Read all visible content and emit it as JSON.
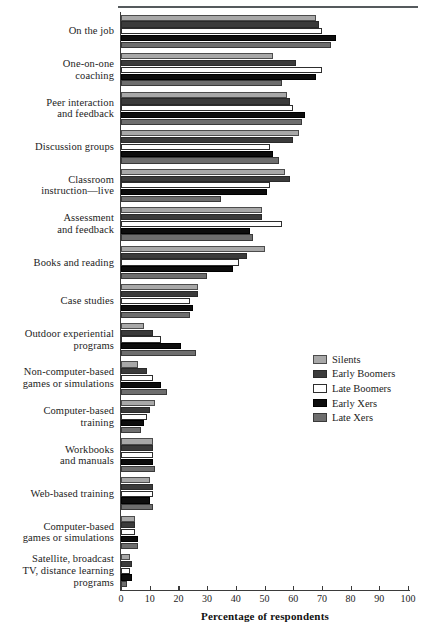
{
  "chart_data": {
    "type": "bar",
    "orientation": "horizontal",
    "title": "",
    "xlabel": "Percentage of respondents",
    "ylabel": "",
    "xlim": [
      0,
      100
    ],
    "xticks": [
      0,
      10,
      20,
      30,
      40,
      50,
      60,
      70,
      80,
      90,
      100
    ],
    "grid": false,
    "legend_position": "middle-right",
    "categories": [
      "On the job",
      "One-on-one\ncoaching",
      "Peer interaction\nand feedback",
      "Discussion groups",
      "Classroom\ninstruction—live",
      "Assessment\nand feedback",
      "Books and reading",
      "Case studies",
      "Outdoor experiential\nprograms",
      "Non-computer-based\ngames or simulations",
      "Computer-based\ntraining",
      "Workbooks\nand manuals",
      "Web-based training",
      "Computer-based\ngames or simulations",
      "Satellite, broadcast\nTV, distance learning\nprograms"
    ],
    "series": [
      {
        "name": "Silents",
        "color": "#a8a8a8",
        "values": [
          68,
          53,
          58,
          62,
          57,
          49,
          50,
          27,
          8,
          6,
          12,
          11,
          10,
          5,
          3
        ]
      },
      {
        "name": "Early Boomers",
        "color": "#3b3b3b",
        "values": [
          69,
          61,
          59,
          60,
          59,
          49,
          44,
          27,
          11,
          9,
          10,
          11,
          11,
          5,
          4
        ]
      },
      {
        "name": "Late Boomers",
        "color": "#ffffff",
        "values": [
          70,
          70,
          60,
          52,
          52,
          56,
          41,
          24,
          14,
          11,
          9,
          11,
          11,
          5,
          3
        ]
      },
      {
        "name": "Early Xers",
        "color": "#0d0d0d",
        "values": [
          75,
          68,
          64,
          53,
          51,
          45,
          39,
          25,
          21,
          14,
          8,
          11,
          10,
          6,
          4
        ]
      },
      {
        "name": "Late Xers",
        "color": "#6e6e6e",
        "values": [
          73,
          56,
          63,
          55,
          35,
          46,
          30,
          24,
          26,
          16,
          7,
          12,
          11,
          6,
          2
        ]
      }
    ]
  },
  "axis": {
    "title": "Percentage of respondents",
    "tick_labels": [
      "0",
      "10",
      "20",
      "30",
      "40",
      "50",
      "60",
      "70",
      "80",
      "90",
      "100"
    ]
  },
  "legend": {
    "items": [
      {
        "label": "Silents",
        "key": "silents"
      },
      {
        "label": "Early Boomers",
        "key": "early-boomers"
      },
      {
        "label": "Late Boomers",
        "key": "late-boomers"
      },
      {
        "label": "Early Xers",
        "key": "early-xers"
      },
      {
        "label": "Late Xers",
        "key": "late-xers"
      }
    ]
  }
}
